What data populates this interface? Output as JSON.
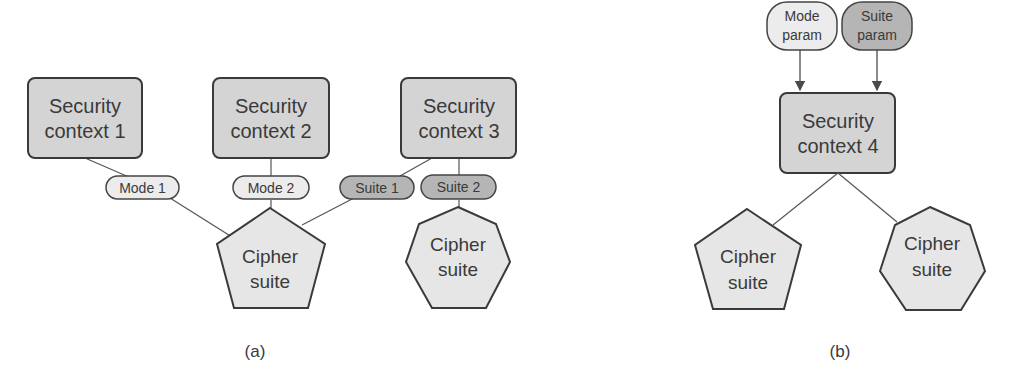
{
  "panel_a": {
    "caption": "(a)",
    "contexts": [
      {
        "line1": "Security",
        "line2": "context 1"
      },
      {
        "line1": "Security",
        "line2": "context 2"
      },
      {
        "line1": "Security",
        "line2": "context 3"
      }
    ],
    "params": [
      {
        "label": "Mode 1",
        "kind": "mode"
      },
      {
        "label": "Mode 2",
        "kind": "mode"
      },
      {
        "label": "Suite 1",
        "kind": "suite"
      },
      {
        "label": "Suite 2",
        "kind": "suite"
      }
    ],
    "cipher_suites": [
      {
        "line1": "Cipher",
        "line2": "suite",
        "shape": "pentagon"
      },
      {
        "line1": "Cipher",
        "line2": "suite",
        "shape": "heptagon"
      }
    ]
  },
  "panel_b": {
    "caption": "(b)",
    "params": [
      {
        "line1": "Mode",
        "line2": "param",
        "kind": "mode"
      },
      {
        "line1": "Suite",
        "line2": "param",
        "kind": "suite"
      }
    ],
    "context": {
      "line1": "Security",
      "line2": "context 4"
    },
    "cipher_suites": [
      {
        "line1": "Cipher",
        "line2": "suite",
        "shape": "pentagon"
      },
      {
        "line1": "Cipher",
        "line2": "suite",
        "shape": "heptagon"
      }
    ]
  },
  "colors": {
    "context_fill": "#d4d4d4",
    "mode_fill": "#ececec",
    "suite_fill": "#b5b5b5",
    "cipher_fill": "#e6e6e6",
    "stroke": "#4a4a4a"
  }
}
